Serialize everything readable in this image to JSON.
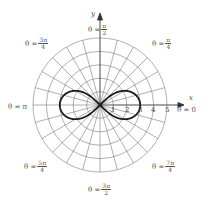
{
  "diagram": {
    "type": "polar-graph",
    "curve": "lemniscate",
    "curve_equation_implied": "r^2 = 9 cos(2θ)",
    "curve_max_r": 3,
    "grid": {
      "circles": 5,
      "radial_step_deg": 15
    },
    "axes": {
      "x_label": "x",
      "y_label": "y"
    },
    "r_ticks": [
      "1",
      "2",
      "3",
      "4",
      "5"
    ],
    "angle_labels": [
      {
        "prefix": "θ =",
        "value": "0"
      },
      {
        "prefix": "θ =",
        "num": "π",
        "den": "4"
      },
      {
        "prefix": "θ =",
        "num": "π",
        "den": "2"
      },
      {
        "prefix": "θ =",
        "num": "3π",
        "den": "4"
      },
      {
        "prefix": "θ =",
        "value": "π"
      },
      {
        "prefix": "θ =",
        "num": "5π",
        "den": "4"
      },
      {
        "prefix": "θ =",
        "num": "3π",
        "den": "2"
      },
      {
        "prefix": "θ =",
        "num": "7π",
        "den": "4"
      }
    ],
    "colors": {
      "grid": "#6a6a6a",
      "curve": "#1a1a1a",
      "text": "#555555"
    }
  }
}
